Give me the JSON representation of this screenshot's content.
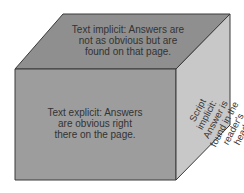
{
  "diagram": {
    "title": "",
    "faces": {
      "top": {
        "lines": [
          "Text implicit: Answers are",
          "not as obvious but are",
          "found on that page."
        ],
        "color": "#8f8f8f"
      },
      "front": {
        "lines": [
          "Text explicit: Answers",
          "are obvious right",
          "there on the page."
        ],
        "color": "#9d9d9d"
      },
      "side": {
        "lines": [
          "Script",
          "implicit:",
          "Answer is",
          "found in the",
          "reader's",
          "head."
        ],
        "color": "#c8c8c8"
      }
    },
    "edge_color": "#3a3a3a"
  }
}
